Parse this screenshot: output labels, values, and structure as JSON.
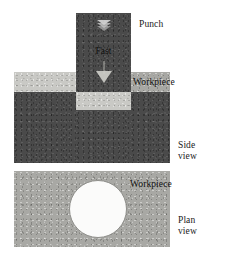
{
  "figure": {
    "background_color": "#ffffff"
  },
  "colors": {
    "punch": "#4a4a4a",
    "workpiece_dark": "#4a4a4a",
    "workpiece_mid": "#a8a8a4",
    "workpiece_light": "#c9c9c5",
    "slug": "#c9c9c5",
    "hole": "#fbfbfa",
    "text": "#1a1a1a"
  },
  "side_view": {
    "punch": {
      "label": "Punch",
      "motion_label": "Fast",
      "down_chevron_icon": "double-chevron-down-icon",
      "down_arrow_icon": "triangle-down-icon"
    },
    "workpiece": {
      "label": "Workpiece"
    },
    "slug": {
      "label": ""
    },
    "view_label": "Side\nview"
  },
  "plan_view": {
    "workpiece": {
      "label": "Workpiece"
    },
    "hole": {
      "label": "",
      "icon": "circle-hole-icon"
    },
    "view_label": "Plan\nview"
  }
}
